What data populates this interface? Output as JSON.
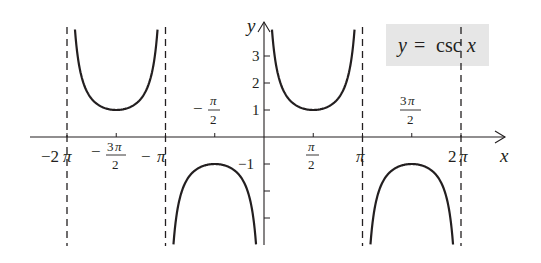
{
  "chart_data": {
    "type": "line",
    "title": "y = csc x",
    "function": "csc",
    "legend": {
      "text": "y = csc x",
      "position": "top-right",
      "box_color": "#e6e6e6"
    },
    "xlabel": "x",
    "ylabel": "y",
    "xlim": [
      -6.7,
      8.1
    ],
    "ylim": [
      -4,
      4
    ],
    "grid": false,
    "x_ticks": [
      {
        "value": -6.2832,
        "label": "−2π"
      },
      {
        "value": -4.7124,
        "label": "−3π/2"
      },
      {
        "value": -3.1416,
        "label": "−π"
      },
      {
        "value": -1.5708,
        "label": "−π/2"
      },
      {
        "value": 1.5708,
        "label": "π/2"
      },
      {
        "value": 3.1416,
        "label": "π"
      },
      {
        "value": 4.7124,
        "label": "3π/2"
      },
      {
        "value": 6.2832,
        "label": "2π"
      }
    ],
    "y_ticks": [
      {
        "value": 3,
        "label": "3"
      },
      {
        "value": 2,
        "label": "2"
      },
      {
        "value": 1,
        "label": "1"
      },
      {
        "value": -1,
        "label": "−1"
      },
      {
        "value": -2,
        "label": ""
      },
      {
        "value": -3,
        "label": ""
      }
    ],
    "asymptotes": [
      -6.2832,
      -3.1416,
      3.1416,
      6.2832
    ],
    "series": [
      {
        "name": "csc x branch 1",
        "domain": [
          -6.2832,
          -3.1416
        ],
        "vertex": {
          "x": -4.7124,
          "y": 1
        }
      },
      {
        "name": "csc x branch 2",
        "domain": [
          -3.1416,
          0
        ],
        "vertex": {
          "x": -1.5708,
          "y": -1
        }
      },
      {
        "name": "csc x branch 3",
        "domain": [
          0,
          3.1416
        ],
        "vertex": {
          "x": 1.5708,
          "y": 1
        }
      },
      {
        "name": "csc x branch 4",
        "domain": [
          3.1416,
          6.2832
        ],
        "vertex": {
          "x": 4.7124,
          "y": -1
        }
      }
    ]
  },
  "labels": {
    "x_axis": "x",
    "y_axis": "y",
    "legend_y": "y",
    "legend_eq": "=",
    "legend_fn": "csc",
    "legend_x": "x",
    "tick_neg2pi": "−2",
    "tick_pi": "π",
    "tick_neg": "−",
    "tick_2": "2",
    "tick_3": "3",
    "tick_2pi_coef": "2",
    "y3": "3",
    "y2": "2",
    "y1": "1",
    "yneg1": "−1"
  }
}
